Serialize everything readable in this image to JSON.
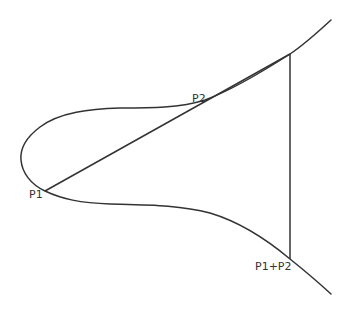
{
  "diagram": {
    "colors": {
      "stroke": "#333333",
      "background": "#ffffff"
    },
    "points": {
      "p1": {
        "label": "P1",
        "x": 45,
        "y": 191
      },
      "p2": {
        "label": "P2",
        "x": 205,
        "y": 100
      },
      "third_intersection": {
        "x": 290,
        "y": 54
      },
      "sum": {
        "label": "P1+P2",
        "x": 290,
        "y": 259
      }
    },
    "labels": {
      "p1": "P1",
      "p2": "P2",
      "sum": "P1+P2"
    }
  }
}
